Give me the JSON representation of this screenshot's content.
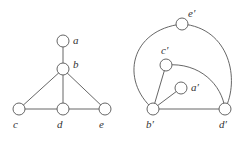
{
  "graph_left": {
    "nodes": [
      {
        "id": "a",
        "label": "a"
      },
      {
        "id": "b",
        "label": "b"
      },
      {
        "id": "c",
        "label": "c"
      },
      {
        "id": "d",
        "label": "d"
      },
      {
        "id": "e",
        "label": "e"
      }
    ],
    "edges": [
      [
        "a",
        "b"
      ],
      [
        "b",
        "c"
      ],
      [
        "b",
        "d"
      ],
      [
        "b",
        "e"
      ],
      [
        "c",
        "d"
      ],
      [
        "d",
        "e"
      ]
    ]
  },
  "graph_right": {
    "nodes": [
      {
        "id": "a'",
        "label": "a′"
      },
      {
        "id": "b'",
        "label": "b′"
      },
      {
        "id": "c'",
        "label": "c′"
      },
      {
        "id": "d'",
        "label": "d′"
      },
      {
        "id": "e'",
        "label": "e′"
      }
    ],
    "edges": [
      [
        "b'",
        "a'"
      ],
      [
        "b'",
        "c'"
      ],
      [
        "b'",
        "d'"
      ],
      [
        "c'",
        "d'"
      ],
      [
        "b'",
        "e'"
      ],
      [
        "e'",
        "d'"
      ]
    ]
  }
}
